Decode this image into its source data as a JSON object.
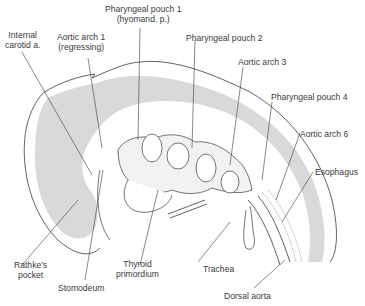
{
  "diagram": {
    "colors": {
      "neural_tube_fill": "#d9d9d9",
      "outline": "#3a3a3a",
      "label_text": "#3a3a3a",
      "background": "#ffffff"
    },
    "labels": [
      {
        "id": "internal-carotid",
        "line1": "Internal",
        "line2": "carotid a."
      },
      {
        "id": "aortic-arch-1",
        "line1": "Aortic arch 1",
        "line2": "(regressing)"
      },
      {
        "id": "pharyngeal-pouch-1",
        "line1": "Pharyngeal pouch 1",
        "line2": "(hyomand. p.)"
      },
      {
        "id": "pharyngeal-pouch-2",
        "line1": "Pharyngeal pouch 2"
      },
      {
        "id": "aortic-arch-3",
        "line1": "Aortic arch 3"
      },
      {
        "id": "pharyngeal-pouch-4",
        "line1": "Pharyngeal pouch 4"
      },
      {
        "id": "aortic-arch-6",
        "line1": "Aortic arch 6"
      },
      {
        "id": "esophagus",
        "line1": "Esophagus"
      },
      {
        "id": "rathkes-pocket",
        "line1": "Rathke's",
        "line2": "pocket"
      },
      {
        "id": "stomodeum",
        "line1": "Stomodeum"
      },
      {
        "id": "thyroid-primordium",
        "line1": "Thyroid",
        "line2": "primordium"
      },
      {
        "id": "trachea",
        "line1": "Trachea"
      },
      {
        "id": "dorsal-aorta",
        "line1": "Dorsal aorta"
      }
    ]
  }
}
